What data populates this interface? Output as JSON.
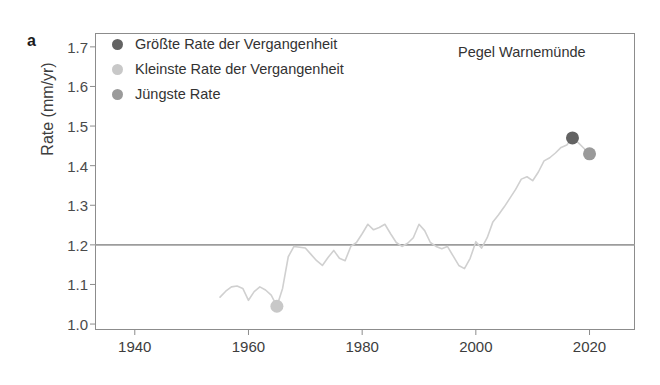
{
  "figure": {
    "panel_label": "a",
    "annotation": "Pegel Warnemünde",
    "background_color": "#ffffff"
  },
  "legend": {
    "position": "top-left-inside",
    "items": [
      {
        "label": "Größte Rate der Vergangenheit",
        "color": "#636363",
        "marker": "circle"
      },
      {
        "label": "Kleinste Rate der Vergangenheit",
        "color": "#c8c8c8",
        "marker": "circle"
      },
      {
        "label": "Jüngste Rate",
        "color": "#9a9a9a",
        "marker": "circle"
      }
    ]
  },
  "axes": {
    "y_title": "Rate (mm/yr)",
    "y_ticks": [
      "1.0",
      "1.1",
      "1.2",
      "1.3",
      "1.4",
      "1.5",
      "1.6",
      "1.7"
    ],
    "x_ticks": [
      "1940",
      "1960",
      "1980",
      "2000",
      "2020"
    ]
  },
  "chart_data": {
    "type": "line",
    "title": "",
    "subtitle": "",
    "xlabel": "",
    "ylabel": "Rate (mm/yr)",
    "xlim": [
      1933,
      2028
    ],
    "ylim": [
      0.985,
      1.735
    ],
    "grid": false,
    "legend_position": "top-left",
    "annotations": [
      {
        "text": "Pegel Warnemünde",
        "x": 2001,
        "ydata": 1.675
      },
      {
        "text": "a",
        "x": 1933,
        "ydata": 1.715
      }
    ],
    "reference_lines": [
      {
        "orientation": "horizontal",
        "ydata": 1.2,
        "color": "#9c9c9c",
        "width": 1.6
      }
    ],
    "series": [
      {
        "name": "Trend rate series",
        "color": "#d0d0d0",
        "width": 1.6,
        "x": [
          1955,
          1956,
          1957,
          1958,
          1959,
          1960,
          1961,
          1962,
          1963,
          1964,
          1965,
          1966,
          1967,
          1968,
          1969,
          1970,
          1971,
          1972,
          1973,
          1974,
          1975,
          1976,
          1977,
          1978,
          1979,
          1980,
          1981,
          1982,
          1983,
          1984,
          1985,
          1986,
          1987,
          1988,
          1989,
          1990,
          1991,
          1992,
          1993,
          1994,
          1995,
          1996,
          1997,
          1998,
          1999,
          2000,
          2001,
          2002,
          2003,
          2004,
          2005,
          2006,
          2007,
          2008,
          2009,
          2010,
          2011,
          2012,
          2013,
          2014,
          2015,
          2016,
          2017,
          2018,
          2019,
          2020
        ],
        "values": [
          1.068,
          1.083,
          1.094,
          1.096,
          1.09,
          1.06,
          1.082,
          1.094,
          1.086,
          1.073,
          1.045,
          1.09,
          1.17,
          1.196,
          1.194,
          1.192,
          1.176,
          1.16,
          1.148,
          1.168,
          1.186,
          1.166,
          1.16,
          1.196,
          1.206,
          1.228,
          1.252,
          1.238,
          1.244,
          1.252,
          1.228,
          1.206,
          1.196,
          1.204,
          1.218,
          1.252,
          1.236,
          1.206,
          1.196,
          1.19,
          1.196,
          1.172,
          1.148,
          1.14,
          1.166,
          1.208,
          1.192,
          1.218,
          1.258,
          1.276,
          1.296,
          1.318,
          1.34,
          1.366,
          1.372,
          1.362,
          1.384,
          1.412,
          1.42,
          1.432,
          1.446,
          1.452,
          1.47,
          1.458,
          1.444,
          1.43
        ]
      }
    ],
    "highlight_points": [
      {
        "name": "Größte Rate der Vergangenheit",
        "x": 2017,
        "ydata": 1.47,
        "color": "#636363",
        "radius": 6.5
      },
      {
        "name": "Kleinste Rate der Vergangenheit",
        "x": 1965,
        "ydata": 1.045,
        "color": "#c8c8c8",
        "radius": 6.5
      },
      {
        "name": "Jüngste Rate",
        "x": 2020,
        "ydata": 1.43,
        "color": "#9a9a9a",
        "radius": 6.5
      }
    ]
  }
}
